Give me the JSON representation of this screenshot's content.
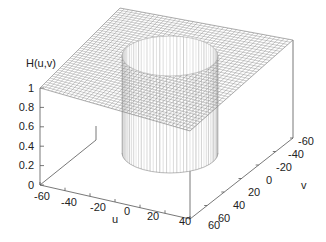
{
  "chart_data": {
    "type": "surface3d",
    "title": "",
    "xlabel": "u",
    "ylabel": "v",
    "zlabel": "H(u,v)",
    "xlim": [
      -60,
      60
    ],
    "ylim": [
      -60,
      60
    ],
    "zlim": [
      0,
      1
    ],
    "x_ticks": [
      "-60",
      "-40",
      "-20",
      "0",
      "20",
      "40",
      "60"
    ],
    "y_ticks": [
      "-60",
      "-40",
      "-20",
      "0",
      "20",
      "40",
      "60"
    ],
    "z_ticks": [
      "0",
      "0.2",
      "0.4",
      "0.6",
      "0.8",
      "1"
    ],
    "surface": {
      "value_outside_cutoff": 1,
      "value_inside_cutoff": 0,
      "cutoff_radius_approx": 30,
      "grid": true
    },
    "grid": false,
    "legend": null
  },
  "labels": {
    "zlabel": "H(u,v)",
    "xlabel": "u",
    "ylabel": "v",
    "z_ticks": [
      "1",
      "0.8",
      "0.6",
      "0.4",
      "0.2",
      "0"
    ],
    "x_ticks": [
      "-60",
      "-40",
      "-20",
      "0",
      "20",
      "40",
      "60"
    ],
    "y_ticks": [
      "-60",
      "-40",
      "-20",
      "0",
      "20",
      "40",
      "60"
    ]
  },
  "colors": {
    "mesh": "#8a8a8a",
    "axis": "#555555",
    "text": "#222222",
    "background": "#ffffff"
  }
}
